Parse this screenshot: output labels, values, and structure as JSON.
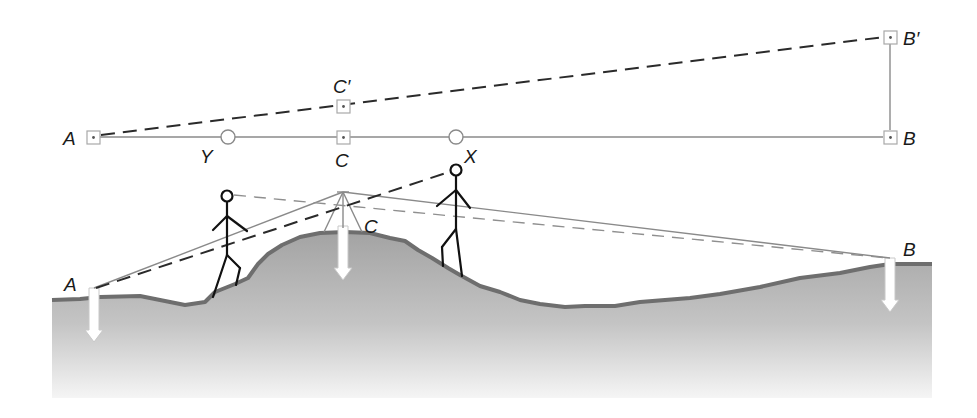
{
  "plan_view": {
    "labels": {
      "A": "A",
      "B": "B",
      "B_prime": "B′",
      "C": "C",
      "C_prime": "C′",
      "X": "X",
      "Y": "Y"
    }
  },
  "section_view": {
    "labels": {
      "A": "A",
      "B": "B",
      "C": "C"
    }
  },
  "colors": {
    "ground_top": "#a6a6a6",
    "ground_bottom": "#f4f4f4",
    "ground_edge": "#6e6e6e",
    "solid_line": "#8a8a8a",
    "dashed_line": "#2a2a2a",
    "figure": "#111111"
  }
}
